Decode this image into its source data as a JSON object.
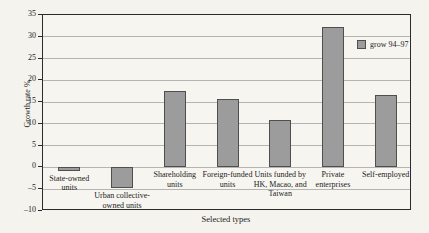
{
  "figure": {
    "xlabel": "Selected types",
    "ylabel": "Growth rate %",
    "legend_label": "grow 94–97"
  },
  "chart_data": {
    "type": "bar",
    "title": "",
    "xlabel": "Selected types",
    "ylabel": "Growth rate %",
    "ylim": [
      -10,
      35
    ],
    "yticks": [
      35,
      30,
      25,
      20,
      15,
      10,
      5,
      0,
      -5,
      -10
    ],
    "grid": true,
    "legend_position": "upper-right-inside",
    "categories": [
      "State-owned units",
      "Urban collective-owned units",
      "Shareholding units",
      "Foreign-funded units",
      "Units funded by HK, Macao, and Taiwan",
      "Private enterprises",
      "Self-employed"
    ],
    "category_label_lines": [
      [
        "State-owned",
        "units"
      ],
      [
        "Urban collective-",
        "owned units"
      ],
      [
        "Shareholding",
        "units"
      ],
      [
        "Foreign-funded",
        "units"
      ],
      [
        "Units funded by",
        "HK, Macao, and",
        "Taiwan"
      ],
      [
        "Private",
        "enterprises"
      ],
      [
        "Self-employed"
      ]
    ],
    "series": [
      {
        "name": "grow 94–97",
        "values": [
          -0.8,
          -4.8,
          17.5,
          15.6,
          10.8,
          32.3,
          16.6
        ]
      }
    ],
    "colors": {
      "bar_fill": "#9c9c9c",
      "bar_border": "#4f4f4f",
      "grid_line": "#b4b4b4",
      "axis_frame": "#2b2b2b",
      "background": "#f5f3ee",
      "text": "#1c1c1c"
    }
  }
}
